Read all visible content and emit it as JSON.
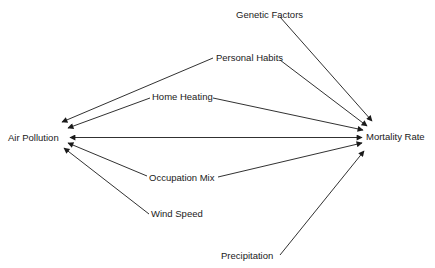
{
  "diagram": {
    "type": "causal-influence-diagram",
    "nodes": {
      "air_pollution": {
        "label": "Air Pollution",
        "x": 8,
        "y": 141
      },
      "mortality_rate": {
        "label": "Mortality Rate",
        "x": 366,
        "y": 140
      },
      "genetic_factors": {
        "label": "Genetic Factors",
        "x": 236,
        "y": 18
      },
      "personal_habits": {
        "label": "Personal Habits",
        "x": 216,
        "y": 61
      },
      "home_heating": {
        "label": "Home Heating",
        "x": 152,
        "y": 100
      },
      "occupation_mix": {
        "label": "Occupation Mix",
        "x": 149,
        "y": 181
      },
      "wind_speed": {
        "label": "Wind Speed",
        "x": 151,
        "y": 217
      },
      "precipitation": {
        "label": "Precipitation",
        "x": 221,
        "y": 259
      }
    },
    "edges": [
      {
        "from": "Genetic Factors",
        "to": "Mortality Rate"
      },
      {
        "from": "Personal Habits",
        "to": "Mortality Rate"
      },
      {
        "from": "Personal Habits",
        "to": "Air Pollution"
      },
      {
        "from": "Home Heating",
        "to": "Mortality Rate"
      },
      {
        "from": "Home Heating",
        "to": "Air Pollution"
      },
      {
        "from": "Air Pollution",
        "to": "Mortality Rate",
        "bidirectional": true
      },
      {
        "from": "Occupation Mix",
        "to": "Air Pollution"
      },
      {
        "from": "Occupation Mix",
        "to": "Mortality Rate"
      },
      {
        "from": "Wind Speed",
        "to": "Air Pollution"
      },
      {
        "from": "Precipitation",
        "to": "Mortality Rate"
      }
    ],
    "colors": {
      "line": "#1a1a1a",
      "text": "#1a1a1a",
      "background": "#ffffff"
    }
  }
}
